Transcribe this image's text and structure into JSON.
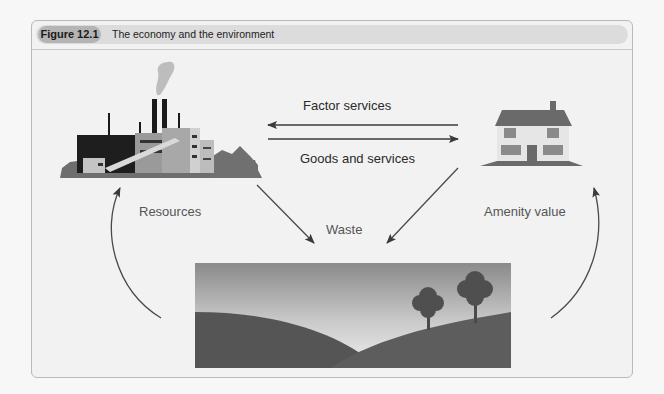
{
  "figure": {
    "label": "Figure 12.1",
    "title": "The economy and the environment"
  },
  "labels": {
    "factor_services": "Factor services",
    "goods_and_services": "Goods and services",
    "resources": "Resources",
    "waste": "Waste",
    "amenity_value": "Amenity value"
  },
  "nodes": {
    "factory": "factory-illustration",
    "house": "house-illustration",
    "environment": "landscape-illustration"
  },
  "colors": {
    "panel_bg": "#f2f2f2",
    "header_bg": "#dcdcdc",
    "label_pill": "#b4b4b4",
    "arrow": "#4a4a4a"
  }
}
